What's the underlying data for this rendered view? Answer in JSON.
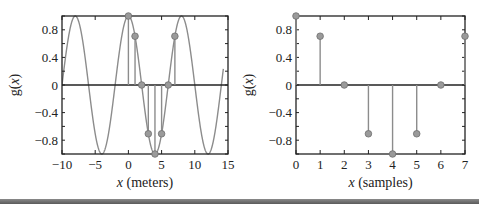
{
  "chart_data": [
    {
      "type": "line+stem",
      "title": "",
      "xlabel_italic": "x",
      "xlabel_rest": " (meters)",
      "ylabel": "g(x)",
      "xlim": [
        -10,
        15
      ],
      "ylim": [
        -1,
        1
      ],
      "xticks": [
        -10,
        -5,
        0,
        5,
        10,
        15
      ],
      "xtick_labels": [
        "−10",
        "−5",
        "0",
        "5",
        "10",
        "15"
      ],
      "yticks": [
        0.8,
        0.4,
        0,
        -0.4,
        -0.8
      ],
      "ytick_labels": [
        "0.8",
        "0.4",
        "0",
        "−0.4",
        "−0.8"
      ],
      "grid": false,
      "continuous_curve": {
        "function": "cos(pi*x/4)",
        "x_range": [
          -10,
          14.3
        ]
      },
      "stems": {
        "x": [
          0,
          1,
          2,
          3,
          4,
          5,
          6,
          7
        ],
        "y": [
          1,
          0.707,
          0,
          -0.707,
          -1,
          -0.707,
          0,
          0.707
        ]
      }
    },
    {
      "type": "stem",
      "title": "",
      "xlabel_italic": "x",
      "xlabel_rest": " (samples)",
      "ylabel": "g(x)",
      "xlim": [
        0,
        7
      ],
      "ylim": [
        -1,
        1
      ],
      "xticks": [
        0,
        1,
        2,
        3,
        4,
        5,
        6,
        7
      ],
      "xtick_labels": [
        "0",
        "1",
        "2",
        "3",
        "4",
        "5",
        "6",
        "7"
      ],
      "yticks": [
        0.8,
        0.4,
        0,
        -0.4,
        -0.8
      ],
      "ytick_labels": [
        "0.8",
        "0.4",
        "0",
        "−0.4",
        "−0.8"
      ],
      "grid": false,
      "stems": {
        "x": [
          0,
          1,
          2,
          3,
          4,
          5,
          6,
          7
        ],
        "y": [
          1,
          0.707,
          0,
          -0.707,
          -1,
          -0.707,
          0,
          0.707
        ]
      }
    }
  ],
  "colors": {
    "curve": "#8c8c8c",
    "marker_fill": "#9a9a9a",
    "marker_edge": "#6e6e6e",
    "axis": "#222222"
  }
}
